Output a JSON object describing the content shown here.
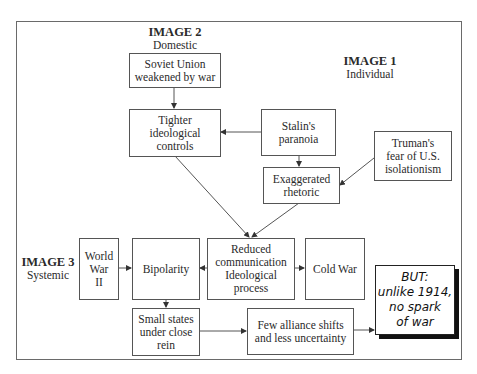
{
  "diagram": {
    "levels": {
      "image1": {
        "title": "IMAGE 1",
        "subtitle": "Individual"
      },
      "image2": {
        "title": "IMAGE 2",
        "subtitle": "Domestic"
      },
      "image3": {
        "title": "IMAGE 3",
        "subtitle": "Systemic"
      }
    },
    "nodes": {
      "soviet_union": "Soviet Union\nweakened by war",
      "tighter_controls": "Tighter\nideological\ncontrols",
      "stalin_paranoia": "Stalin's\nparanoia",
      "exaggerated_rhetoric": "Exaggerated\nrhetoric",
      "truman_fear": "Truman's\nfear of U.S.\nisolationism",
      "world_war_ii": "World\nWar\nII",
      "bipolarity": "Bipolarity",
      "reduced_communication": "Reduced\ncommunication\nIdeological\nprocess",
      "cold_war": "Cold War",
      "small_states": "Small states\nunder close\nrein",
      "few_alliance_shifts": "Few alliance shifts\nand less uncertainty",
      "but_callout": "BUT:\nunlike 1914,\nno spark\nof war"
    },
    "edges": [
      {
        "from": "soviet_union",
        "to": "tighter_controls"
      },
      {
        "from": "stalin_paranoia",
        "to": "tighter_controls"
      },
      {
        "from": "stalin_paranoia",
        "to": "exaggerated_rhetoric"
      },
      {
        "from": "truman_fear",
        "to": "exaggerated_rhetoric"
      },
      {
        "from": "tighter_controls",
        "to": "reduced_communication"
      },
      {
        "from": "exaggerated_rhetoric",
        "to": "reduced_communication"
      },
      {
        "from": "world_war_ii",
        "to": "bipolarity"
      },
      {
        "from": "reduced_communication",
        "to": "bipolarity"
      },
      {
        "from": "reduced_communication",
        "to": "cold_war"
      },
      {
        "from": "bipolarity",
        "to": "small_states"
      },
      {
        "from": "small_states",
        "to": "few_alliance_shifts"
      },
      {
        "from": "few_alliance_shifts",
        "to": "but_callout"
      }
    ],
    "colors": {
      "line": "#555555",
      "shadow": "#111111",
      "background": "#ffffff"
    }
  }
}
